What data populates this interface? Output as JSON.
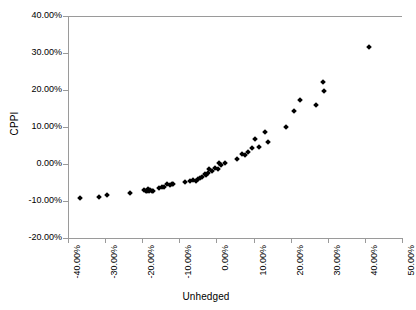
{
  "chart_data": {
    "type": "scatter",
    "title": "",
    "xlabel": "Unhedged",
    "ylabel": "CPPI",
    "xlim": [
      -40,
      50
    ],
    "ylim": [
      -20,
      40
    ],
    "grid": false,
    "legend": null,
    "x_tick_labels": [
      "-40.00%",
      "-30.00%",
      "-20.00%",
      "-10.00%",
      "0.00%",
      "10.00%",
      "20.00%",
      "30.00%",
      "40.00%",
      "50.00%"
    ],
    "x_ticks": [
      -40,
      -30,
      -20,
      -10,
      0,
      10,
      20,
      30,
      40,
      50
    ],
    "y_tick_labels": [
      "40.00%",
      "30.00%",
      "20.00%",
      "10.00%",
      "0.00%",
      "-10.00%",
      "-20.00%"
    ],
    "y_ticks": [
      40,
      30,
      20,
      10,
      0,
      -10,
      -20
    ],
    "marker": "diamond",
    "marker_color": "#000000",
    "series": [
      {
        "name": "CPPI vs Unhedged",
        "points": [
          [
            -36.7,
            -9.1
          ],
          [
            -31.6,
            -8.8
          ],
          [
            -29.6,
            -8.5
          ],
          [
            -23.4,
            -7.8
          ],
          [
            -19.4,
            -7.0
          ],
          [
            -18.9,
            -7.2
          ],
          [
            -18.6,
            -7.4
          ],
          [
            -18.4,
            -6.8
          ],
          [
            -18.1,
            -7.3
          ],
          [
            -17.8,
            -7.1
          ],
          [
            -17.5,
            -7.4
          ],
          [
            -17.2,
            -7.2
          ],
          [
            -15.6,
            -6.6
          ],
          [
            -14.8,
            -6.3
          ],
          [
            -14.0,
            -6.2
          ],
          [
            -13.2,
            -5.4
          ],
          [
            -12.4,
            -5.6
          ],
          [
            -11.9,
            -5.5
          ],
          [
            -11.6,
            -5.3
          ],
          [
            -8.6,
            -4.8
          ],
          [
            -7.0,
            -4.6
          ],
          [
            -6.2,
            -4.4
          ],
          [
            -5.4,
            -4.5
          ],
          [
            -4.9,
            -4.0
          ],
          [
            -4.3,
            -3.9
          ],
          [
            -3.8,
            -3.4
          ],
          [
            -3.2,
            -2.6
          ],
          [
            -2.9,
            -3.1
          ],
          [
            -2.4,
            -2.3
          ],
          [
            -1.9,
            -1.4
          ],
          [
            -1.3,
            -1.8
          ],
          [
            -0.5,
            -1.1
          ],
          [
            0.3,
            -1.3
          ],
          [
            0.8,
            0.3
          ],
          [
            1.1,
            -0.2
          ],
          [
            2.2,
            0.4
          ],
          [
            5.6,
            1.3
          ],
          [
            7.0,
            2.6
          ],
          [
            7.6,
            2.3
          ],
          [
            8.6,
            3.2
          ],
          [
            9.7,
            4.2
          ],
          [
            10.3,
            6.8
          ],
          [
            11.4,
            4.6
          ],
          [
            13.0,
            8.6
          ],
          [
            13.8,
            6.0
          ],
          [
            18.8,
            10.1
          ],
          [
            20.9,
            14.3
          ],
          [
            22.6,
            17.2
          ],
          [
            26.8,
            16.0
          ],
          [
            28.8,
            22.2
          ],
          [
            29.1,
            19.6
          ],
          [
            41.2,
            31.7
          ]
        ]
      }
    ]
  }
}
